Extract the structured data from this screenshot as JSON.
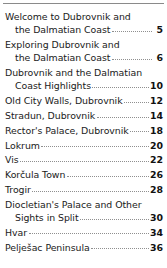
{
  "document": {
    "type": "table-of-contents",
    "top_rule_color": "#8a8a8a",
    "text_color": "#1a1a1a",
    "leader_style": "dotted",
    "entries": [
      {
        "lines": [
          "Welcome to Dubrovnik and",
          "the Dalmatian Coast"
        ],
        "page": "5"
      },
      {
        "lines": [
          "Exploring Dubrovnik and",
          "the Dalmatian Coast"
        ],
        "page": "6"
      },
      {
        "lines": [
          "Dubrovnik and the Dalmatian",
          "Coast Highlights"
        ],
        "page": "10"
      },
      {
        "lines": [
          "Old City Walls, Dubrovnik"
        ],
        "page": "12"
      },
      {
        "lines": [
          "Stradun, Dubrovnik"
        ],
        "page": "14"
      },
      {
        "lines": [
          "Rector's Palace, Dubrovnik"
        ],
        "page": "18"
      },
      {
        "lines": [
          "Lokrum"
        ],
        "page": "20"
      },
      {
        "lines": [
          "Vis"
        ],
        "page": "22"
      },
      {
        "lines": [
          "Korčula Town"
        ],
        "page": "26"
      },
      {
        "lines": [
          "Trogir"
        ],
        "page": "28"
      },
      {
        "lines": [
          "Diocletian's Palace and Other",
          "Sights in Split"
        ],
        "page": "30"
      },
      {
        "lines": [
          "Hvar"
        ],
        "page": "34"
      },
      {
        "lines": [
          "Pelješac Peninsula"
        ],
        "page": "36"
      }
    ]
  }
}
